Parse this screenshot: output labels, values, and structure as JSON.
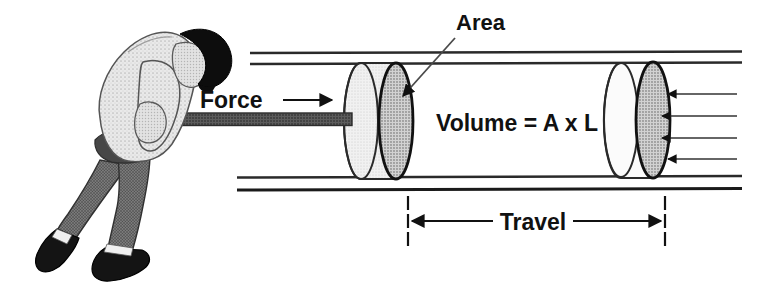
{
  "figure": {
    "background_color": "#ffffff",
    "width": 762,
    "height": 293
  },
  "labels": {
    "force": "Force",
    "area": "Area",
    "volume": "Volume = A x L",
    "travel": "Travel"
  },
  "icons": {
    "force_arrow": "arrow-right-icon",
    "area_leader": "leader-line-arrow-icon",
    "pressure_arrows": "arrow-left-icon",
    "travel_left_arrow": "arrow-left-icon",
    "travel_right_arrow": "arrow-right-icon"
  },
  "colors": {
    "ink": "#111111",
    "outline": "#1a1a1a",
    "piston_face_fill": "#b8b8b8",
    "piston_body_fill": "#ececec",
    "piston_body_fill_right": "#f7f7f7",
    "rod_fill": "#4a4a4a",
    "pants_fill": "#6e6e6e",
    "shirt_fill": "#e4e4e4",
    "hair_fill": "#101010",
    "shoe_fill": "#1a1a1a",
    "skin_fill": "#d8d8d8",
    "sock_fill": "#f2f2f2"
  },
  "person": {
    "name": "person-pushing-piston",
    "description": "Man bent forward pushing a rod into a cylinder",
    "parts": [
      "head",
      "hair",
      "arm",
      "shirt",
      "pants",
      "front-shoe",
      "back-shoe",
      "sock"
    ]
  },
  "cylinder": {
    "name": "cylinder-walls",
    "top_lines": 2,
    "bottom_lines": 2,
    "left_x": 250,
    "right_x": 742,
    "top_y": 54,
    "bottom_y": 189
  },
  "pistons": [
    {
      "name": "piston-left-start-position",
      "face_center_x": 396,
      "face_center_y": 121,
      "face_rx": 17,
      "face_ry": 58,
      "body_back_x": 361
    },
    {
      "name": "piston-right-end-position",
      "face_center_x": 653,
      "face_center_y": 120,
      "face_rx": 17,
      "face_ry": 58,
      "body_back_x": 621
    }
  ],
  "rod": {
    "name": "piston-rod",
    "x1": 132,
    "x2": 352,
    "y": 119,
    "thickness": 12
  },
  "pressure_arrows": {
    "count": 4,
    "tail_x": 737,
    "head_x": 666,
    "ys": [
      94,
      116,
      138,
      159
    ]
  },
  "travel_dimension": {
    "left_x": 408,
    "right_x": 665,
    "arrow_y": 221,
    "tick_dashes": 3
  }
}
